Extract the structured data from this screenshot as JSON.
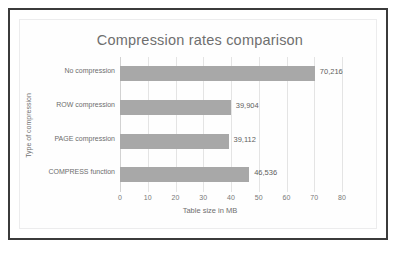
{
  "chart_data": {
    "type": "bar",
    "orientation": "horizontal",
    "title": "Compression rates comparison",
    "xlabel": "Table size in MB",
    "ylabel": "Type of compression",
    "categories": [
      "No compression",
      "ROW compression",
      "PAGE compression",
      "COMPRESS function"
    ],
    "values": [
      70.216,
      39.904,
      39.112,
      46.536
    ],
    "value_labels": [
      "70,216",
      "39,904",
      "39,112",
      "46,536"
    ],
    "xticks": [
      "0",
      "10",
      "20",
      "30",
      "40",
      "50",
      "60",
      "70",
      "80"
    ],
    "xtick_values": [
      0,
      10,
      20,
      30,
      40,
      50,
      60,
      70,
      80
    ],
    "xlim": [
      0,
      80
    ],
    "grid": "vertical",
    "legend": "none",
    "bar_color": "#a8a8a8",
    "title_color": "#6f6f6f",
    "gridline_color": "#e4e4e4",
    "frame_color": "#3b3b3b",
    "background": "#ffffff"
  }
}
